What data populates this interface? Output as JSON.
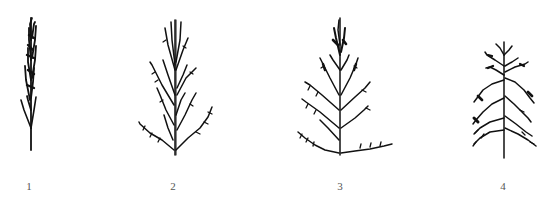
{
  "figure": {
    "ink_color": "#111111",
    "background": "#ffffff",
    "items": [
      {
        "label": "1",
        "form": "compact-narrow-spike"
      },
      {
        "label": "2",
        "form": "upright-branched"
      },
      {
        "label": "3",
        "form": "spreading-pyramidal"
      },
      {
        "label": "4",
        "form": "drooping-branched"
      }
    ]
  }
}
